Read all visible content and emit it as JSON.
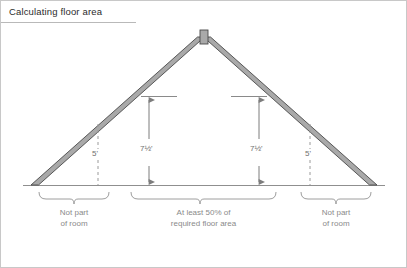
{
  "figure": {
    "title": "Calculating floor area",
    "width": 407,
    "height": 268,
    "background_color": "#ffffff",
    "border_color": "#c8c8c8"
  },
  "colors": {
    "rafter_fill": "#a9a9a9",
    "rafter_stroke": "#4a4a4a",
    "floor_line": "#8f8f8f",
    "dashed_line": "#9a9a9a",
    "dimension_line": "#7d7d7d",
    "brace": "#9e9e9e",
    "text": "#7a7a7a",
    "title_text": "#2b2b2b"
  },
  "dimensions": {
    "left_eave_height": "5'",
    "left_headroom": "7½'",
    "right_headroom": "7½'",
    "right_eave_height": "5'"
  },
  "captions": {
    "left": {
      "line1": "Not part",
      "line2": "of room"
    },
    "center": {
      "line1": "At least 50% of",
      "line2": "required floor area"
    },
    "right": {
      "line1": "Not part",
      "line2": "of room"
    }
  },
  "geometry": {
    "apex_x": 203,
    "apex_y": 30,
    "floor_y": 184,
    "left_eave_x": 30,
    "right_eave_x": 376,
    "rafter_thickness": 9,
    "ridge_width": 7,
    "left_dashed_x": 97,
    "right_dashed_x": 309,
    "left_dim_x": 148,
    "right_dim_x": 258,
    "dim_top_y": 95,
    "braces": [
      {
        "name": "left",
        "x1": 38,
        "x2": 108
      },
      {
        "name": "center",
        "x1": 130,
        "x2": 275
      },
      {
        "name": "right",
        "x1": 300,
        "x2": 370
      }
    ]
  }
}
